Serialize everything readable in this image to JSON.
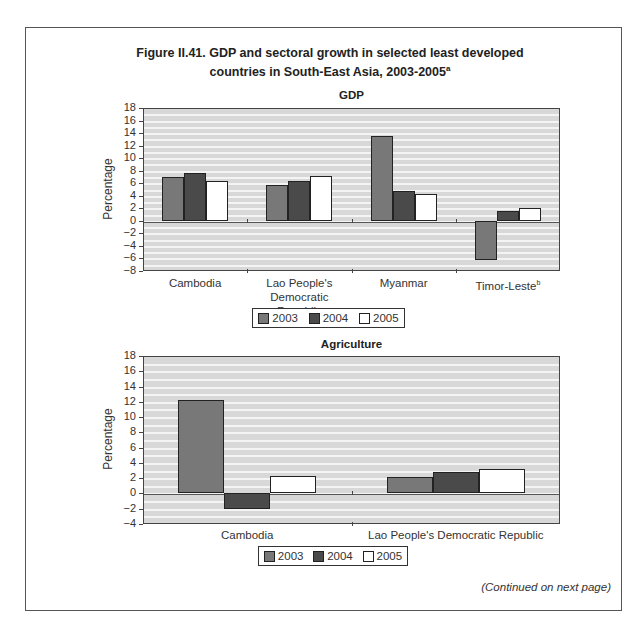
{
  "figure": {
    "title_line1": "Figure II.41. GDP and sectoral growth in selected least developed",
    "title_line2": "countries in South-East Asia, 2003-2005",
    "title_sup": "a",
    "continued_note": "(Continued on next page)"
  },
  "legend": {
    "items": [
      {
        "label": "2003",
        "color": "#787878"
      },
      {
        "label": "2004",
        "color": "#4a4a4a"
      },
      {
        "label": "2005",
        "color": "#ffffff"
      }
    ]
  },
  "chart_data": [
    {
      "type": "bar",
      "title": "GDP",
      "xlabel": "",
      "ylabel": "Percentage",
      "ylim": [
        -8,
        18
      ],
      "yticks": [
        18,
        16,
        14,
        12,
        10,
        8,
        6,
        4,
        2,
        0,
        -2,
        -4,
        -6,
        -8
      ],
      "grid": true,
      "legend_position": "bottom",
      "categories": [
        "Cambodia",
        "Lao People's Democratic Republic",
        "Myanmar",
        "Timor-Leste"
      ],
      "category_labels": [
        [
          "Cambodia"
        ],
        [
          "Lao People's",
          "Democratic Republic"
        ],
        [
          "Myanmar"
        ],
        [
          "Timor-Leste"
        ]
      ],
      "category_sup": [
        "",
        "",
        "",
        "b"
      ],
      "series": [
        {
          "name": "2003",
          "values": [
            7.0,
            5.7,
            13.6,
            -6.2
          ]
        },
        {
          "name": "2004",
          "values": [
            7.7,
            6.4,
            4.8,
            1.5
          ]
        },
        {
          "name": "2005",
          "values": [
            6.3,
            7.1,
            4.3,
            2.1
          ]
        }
      ]
    },
    {
      "type": "bar",
      "title": "Agriculture",
      "xlabel": "",
      "ylabel": "Percentage",
      "ylim": [
        -4,
        18
      ],
      "yticks": [
        18,
        16,
        14,
        12,
        10,
        8,
        6,
        4,
        2,
        0,
        -2,
        -4
      ],
      "grid": true,
      "legend_position": "bottom",
      "categories": [
        "Cambodia",
        "Lao People's Democratic Republic"
      ],
      "category_labels": [
        [
          "Cambodia"
        ],
        [
          "Lao People's Democratic Republic"
        ]
      ],
      "category_sup": [
        "",
        ""
      ],
      "series": [
        {
          "name": "2003",
          "values": [
            12.2,
            2.1
          ]
        },
        {
          "name": "2004",
          "values": [
            -2.0,
            2.8
          ]
        },
        {
          "name": "2005",
          "values": [
            2.3,
            3.2
          ]
        }
      ]
    }
  ]
}
